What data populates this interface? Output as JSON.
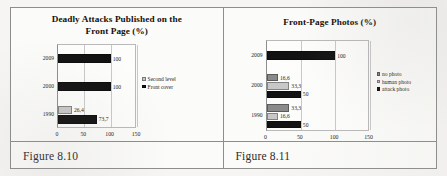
{
  "document": {
    "page_background": "#f6f5f3",
    "frame_color": "#8d8d8d"
  },
  "captions": {
    "left": "Figure 8.10",
    "right": "Figure 8.11"
  },
  "colors": {
    "black": "#111111",
    "dark_gray": "#8a8a8a",
    "light_gray": "#c8c8c8",
    "gridline": "#c9c9c9",
    "plot_border": "#b9b9b9"
  },
  "chart_data": [
    {
      "id": "deadly-attacks",
      "type": "bar",
      "orientation": "horizontal",
      "title": "Deadly Attacks Published on the Front Page (%)",
      "title_lines": [
        "Deadly Attacks Published on the",
        "Front Page (%)"
      ],
      "xlabel": "",
      "ylabel": "",
      "categories": [
        "2009",
        "2000",
        "1990"
      ],
      "xlim": [
        0,
        150
      ],
      "xticks": [
        0,
        50,
        100,
        150
      ],
      "xtick_labels": [
        "0",
        "50",
        "100",
        "150"
      ],
      "grid": true,
      "legend_position": "right",
      "series": [
        {
          "name": "Second level",
          "color": "#c8c8c8",
          "values": [
            null,
            null,
            26.4
          ],
          "labels": [
            "",
            "",
            "26,4"
          ]
        },
        {
          "name": "Front cover",
          "color": "#111111",
          "values": [
            100,
            100,
            73.7
          ],
          "labels": [
            "100",
            "100",
            "73,7"
          ]
        }
      ]
    },
    {
      "id": "front-page-photos",
      "type": "bar",
      "orientation": "horizontal",
      "title": "Front-Page Photos (%)",
      "title_lines": [
        "Front-Page Photos (%)"
      ],
      "xlabel": "",
      "ylabel": "",
      "categories": [
        "2009",
        "2000",
        "1990"
      ],
      "xlim": [
        0,
        150
      ],
      "xticks": [
        0,
        50,
        100,
        150
      ],
      "xtick_labels": [
        "0",
        "50",
        "100",
        "150"
      ],
      "grid": true,
      "legend_position": "right",
      "series": [
        {
          "name": "no photo",
          "color": "#8a8a8a",
          "values": [
            null,
            16.6,
            33.3
          ],
          "labels": [
            "",
            "16,6",
            "33,3"
          ]
        },
        {
          "name": "human photo",
          "color": "#c8c8c8",
          "values": [
            null,
            33.3,
            16.6
          ],
          "labels": [
            "",
            "33,3",
            "16,6"
          ]
        },
        {
          "name": "attack photo",
          "color": "#111111",
          "values": [
            100,
            50,
            50
          ],
          "labels": [
            "100",
            "50",
            "50"
          ]
        }
      ]
    }
  ]
}
